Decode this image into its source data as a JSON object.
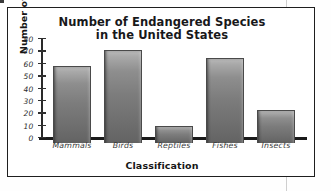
{
  "chart_data": {
    "type": "bar",
    "title": "Number of Endangered Species in the United States",
    "title_lines": [
      "Number of Endangered Species",
      "in the United States"
    ],
    "xlabel": "Classification",
    "ylabel": "Number of Species",
    "categories": [
      "Mammals",
      "Birds",
      "Reptiles",
      "Fishes",
      "Insects"
    ],
    "values": [
      62,
      75,
      14,
      69,
      27
    ],
    "ylim": [
      0,
      80
    ],
    "yticks": [
      0,
      10,
      20,
      30,
      40,
      50,
      60,
      70,
      80
    ],
    "ytick_labels": [
      "0",
      "10",
      "20",
      "30",
      "40",
      "50",
      "60",
      "70",
      "80"
    ],
    "grid": false,
    "legend": false,
    "bar_color": "#7c7c7c",
    "bar_edge_color": "#4a4a4a",
    "axis_color": "#1a1a1a",
    "frame_color": "#1e1e1e",
    "background": "#ffffff"
  }
}
